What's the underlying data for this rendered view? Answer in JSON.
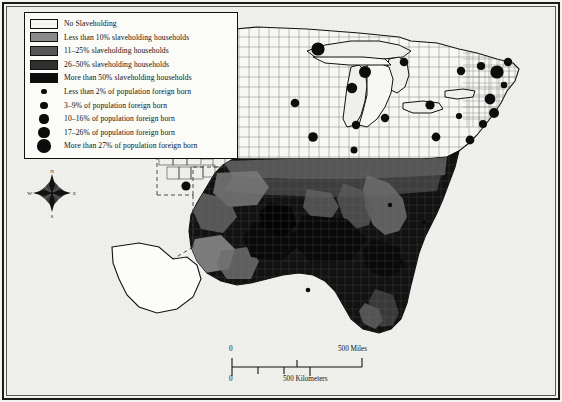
{
  "map": {
    "title": "Slaveholding and Foreign-Born Population by County",
    "background_color": "#efefec",
    "frame_color": "#1a1a1a",
    "land_outline_color": "#111111",
    "county_line_color": "#555555"
  },
  "legend": {
    "background_color": "#fbfbf8",
    "border_color": "#111111",
    "choropleth_title": "",
    "choropleth": [
      {
        "label": "No Slaveholding",
        "color": "#f4f4f1",
        "value_min": 0,
        "value_max": 0
      },
      {
        "label": "Less than 10% slaveholding households",
        "color": "#8a8a8a",
        "value_min": 0,
        "value_max": 10
      },
      {
        "label": "11–25% slaveholding households",
        "color": "#575757",
        "value_min": 11,
        "value_max": 25
      },
      {
        "label": "26–50% slaveholding households",
        "color": "#303030",
        "value_min": 26,
        "value_max": 50
      },
      {
        "label": "More than 50% slaveholding households",
        "color": "#0d0d0d",
        "value_min": 50,
        "value_max": 100
      }
    ],
    "proportional_symbols": [
      {
        "label": "Less than 2% of population foreign born",
        "radius_px": 2.6,
        "color": "#0c0c0c",
        "value_min": 0,
        "value_max": 2
      },
      {
        "label": "3–9% of population foreign born",
        "radius_px": 3.6,
        "color": "#0c0c0c",
        "value_min": 3,
        "value_max": 9
      },
      {
        "label": "10–16% of population foreign born",
        "radius_px": 4.6,
        "color": "#0c0c0c",
        "value_min": 10,
        "value_max": 16
      },
      {
        "label": "17–26% of population foreign born",
        "radius_px": 5.6,
        "color": "#0c0c0c",
        "value_min": 17,
        "value_max": 26
      },
      {
        "label": "More than 27% of population foreign born",
        "radius_px": 6.8,
        "color": "#0c0c0c",
        "value_min": 27,
        "value_max": 100
      }
    ]
  },
  "compass": {
    "north": "N",
    "east": "E",
    "south": "S",
    "west": "W"
  },
  "scale": {
    "miles": {
      "zero": "0",
      "label": "500 Miles"
    },
    "kilometers": {
      "zero": "0",
      "label": "500 Kilometers"
    }
  },
  "chart_data": {
    "type": "map",
    "projection": "conic",
    "symbol_points": [
      {
        "x": 318,
        "y": 49,
        "r": 6.6
      },
      {
        "x": 365,
        "y": 72,
        "r": 6.0
      },
      {
        "x": 295,
        "y": 103,
        "r": 4.3
      },
      {
        "x": 313,
        "y": 137,
        "r": 4.8
      },
      {
        "x": 352,
        "y": 88,
        "r": 5.2
      },
      {
        "x": 385,
        "y": 118,
        "r": 4.2
      },
      {
        "x": 356,
        "y": 125,
        "r": 4.2
      },
      {
        "x": 354,
        "y": 150,
        "r": 3.5
      },
      {
        "x": 404,
        "y": 62,
        "r": 4.3
      },
      {
        "x": 436,
        "y": 137,
        "r": 4.4
      },
      {
        "x": 430,
        "y": 105,
        "r": 4.6
      },
      {
        "x": 461,
        "y": 71,
        "r": 4.2
      },
      {
        "x": 481,
        "y": 66,
        "r": 4.1
      },
      {
        "x": 497,
        "y": 72,
        "r": 6.6
      },
      {
        "x": 508,
        "y": 62,
        "r": 4.2
      },
      {
        "x": 504,
        "y": 85,
        "r": 3.3
      },
      {
        "x": 490,
        "y": 99,
        "r": 5.4
      },
      {
        "x": 494,
        "y": 113,
        "r": 5.0
      },
      {
        "x": 483,
        "y": 124,
        "r": 4.0
      },
      {
        "x": 470,
        "y": 140,
        "r": 4.4
      },
      {
        "x": 459,
        "y": 116,
        "r": 3.1
      },
      {
        "x": 186,
        "y": 186,
        "r": 4.6
      },
      {
        "x": 288,
        "y": 252,
        "r": 2.4
      },
      {
        "x": 330,
        "y": 242,
        "r": 2.3
      },
      {
        "x": 308,
        "y": 290,
        "r": 2.3
      },
      {
        "x": 390,
        "y": 205,
        "r": 2.3
      },
      {
        "x": 424,
        "y": 222,
        "r": 2.2
      },
      {
        "x": 400,
        "y": 262,
        "r": 2.2
      }
    ]
  }
}
